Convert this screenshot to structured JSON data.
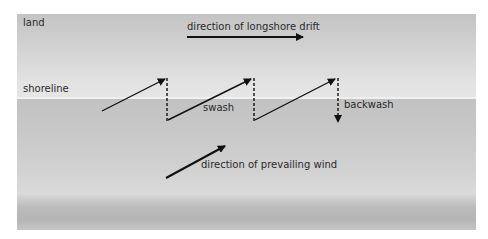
{
  "zones": {
    "land_label": "land",
    "shoreline_label": "shoreline"
  },
  "labels": {
    "longshore_drift": "direction of longshore drift",
    "swash": "swash",
    "backwash": "backwash",
    "prevailing_wind": "direction of prevailing wind"
  },
  "colors": {
    "arrow": "#111111",
    "text": "#2a2a2a",
    "land_top": "#c4c4c4",
    "land_bottom": "#e6e6e6",
    "sea": "#c8c8c8",
    "shoreline": "#f0f0f0"
  }
}
